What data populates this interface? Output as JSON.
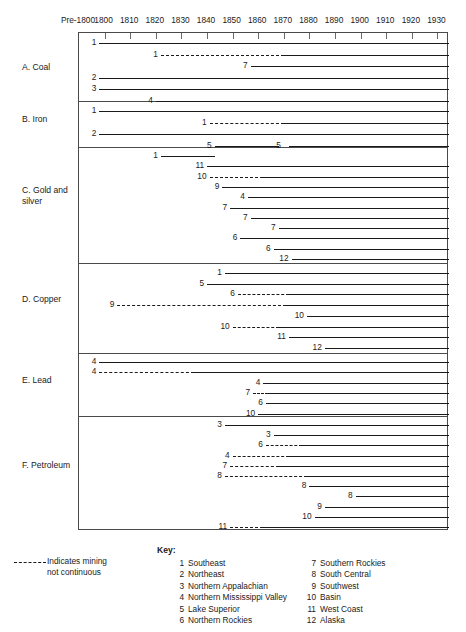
{
  "axis": {
    "ticks": [
      "Pre-1800",
      "1800",
      "1810",
      "1820",
      "1830",
      "1840",
      "1850",
      "1860",
      "1870",
      "1880",
      "1890",
      "1900",
      "1910",
      "1920",
      "1930"
    ]
  },
  "categories": [
    {
      "id": "coal",
      "label": "A. Coal"
    },
    {
      "id": "iron",
      "label": "B. Iron"
    },
    {
      "id": "gold-silver",
      "label": "C. Gold and\n     silver"
    },
    {
      "id": "copper",
      "label": "D. Copper"
    },
    {
      "id": "lead",
      "label": "E. Lead"
    },
    {
      "id": "petroleum",
      "label": "F. Petroleum"
    }
  ],
  "note": {
    "text": "Indicates mining\nnot continuous"
  },
  "key": {
    "title": "Key:",
    "left": [
      {
        "num": "1",
        "label": "Southeast"
      },
      {
        "num": "2",
        "label": "Northeast"
      },
      {
        "num": "3",
        "label": "Northern Appalachian"
      },
      {
        "num": "4",
        "label": "Northern Mississippi Valley"
      },
      {
        "num": "5",
        "label": "Lake Superior"
      },
      {
        "num": "6",
        "label": "Northern Rockies"
      }
    ],
    "right": [
      {
        "num": "7",
        "label": "Southern Rockies"
      },
      {
        "num": "8",
        "label": "South Central"
      },
      {
        "num": "9",
        "label": "Southwest"
      },
      {
        "num": "10",
        "label": "Basin"
      },
      {
        "num": "11",
        "label": "West Coast"
      },
      {
        "num": "12",
        "label": "Alaska"
      }
    ]
  },
  "chart_data": {
    "type": "bar",
    "xlabel": "",
    "ylabel": "",
    "xlim": [
      1795,
      1935
    ],
    "x_ticks": [
      "Pre-1800",
      "1800",
      "1810",
      "1820",
      "1830",
      "1840",
      "1850",
      "1860",
      "1870",
      "1880",
      "1890",
      "1900",
      "1910",
      "1920",
      "1930"
    ],
    "grid": false,
    "legend_position": "bottom",
    "note": "Dashed segments indicate mining not continuous",
    "sections": [
      {
        "name": "A. Coal",
        "bars": [
          {
            "label": "1",
            "start": 1798,
            "end": 1935,
            "segments": [
              {
                "from": 1798,
                "to": 1935,
                "style": "solid"
              }
            ]
          },
          {
            "label": "1",
            "start": 1822,
            "end": 1935,
            "segments": [
              {
                "from": 1822,
                "to": 1870,
                "style": "dashed"
              },
              {
                "from": 1870,
                "to": 1935,
                "style": "solid"
              }
            ]
          },
          {
            "label": "7",
            "start": 1857,
            "end": 1935,
            "segments": [
              {
                "from": 1857,
                "to": 1935,
                "style": "solid"
              }
            ]
          },
          {
            "label": "2",
            "start": 1798,
            "end": 1935,
            "segments": [
              {
                "from": 1798,
                "to": 1935,
                "style": "solid"
              }
            ]
          },
          {
            "label": "3",
            "start": 1798,
            "end": 1935,
            "segments": [
              {
                "from": 1798,
                "to": 1935,
                "style": "solid"
              }
            ]
          },
          {
            "label": "4",
            "start": 1820,
            "end": 1935,
            "segments": [
              {
                "from": 1820,
                "to": 1935,
                "style": "solid"
              }
            ]
          }
        ]
      },
      {
        "name": "B. Iron",
        "bars": [
          {
            "label": "1",
            "start": 1798,
            "end": 1935,
            "segments": [
              {
                "from": 1798,
                "to": 1935,
                "style": "solid"
              }
            ]
          },
          {
            "label": "1",
            "start": 1841,
            "end": 1935,
            "segments": [
              {
                "from": 1841,
                "to": 1870,
                "style": "dashed"
              },
              {
                "from": 1870,
                "to": 1935,
                "style": "solid"
              }
            ]
          },
          {
            "label": "2",
            "start": 1798,
            "end": 1935,
            "segments": [
              {
                "from": 1798,
                "to": 1935,
                "style": "solid"
              }
            ]
          },
          {
            "label": "5",
            "start": 1843,
            "end": 1935,
            "segments": [
              {
                "from": 1843,
                "to": 1868,
                "style": "solid"
              },
              {
                "from": 1872,
                "to": 1935,
                "style": "solid"
              }
            ],
            "inner_label": {
              "num": "5",
              "at": 1870
            }
          }
        ]
      },
      {
        "name": "C. Gold and silver",
        "bars": [
          {
            "label": "1",
            "start": 1822,
            "end": 1843,
            "segments": [
              {
                "from": 1822,
                "to": 1843,
                "style": "solid"
              }
            ]
          },
          {
            "label": "11",
            "start": 1840,
            "end": 1935,
            "segments": [
              {
                "from": 1840,
                "to": 1935,
                "style": "solid"
              }
            ]
          },
          {
            "label": "10",
            "start": 1841,
            "end": 1935,
            "segments": [
              {
                "from": 1841,
                "to": 1862,
                "style": "dashed"
              },
              {
                "from": 1862,
                "to": 1935,
                "style": "solid"
              }
            ]
          },
          {
            "label": "9",
            "start": 1846,
            "end": 1935,
            "segments": [
              {
                "from": 1846,
                "to": 1935,
                "style": "solid"
              }
            ]
          },
          {
            "label": "4",
            "start": 1856,
            "end": 1935,
            "segments": [
              {
                "from": 1856,
                "to": 1935,
                "style": "solid"
              }
            ]
          },
          {
            "label": "7",
            "start": 1849,
            "end": 1935,
            "segments": [
              {
                "from": 1849,
                "to": 1935,
                "style": "solid"
              }
            ]
          },
          {
            "label": "7",
            "start": 1857,
            "end": 1935,
            "segments": [
              {
                "from": 1857,
                "to": 1935,
                "style": "solid"
              }
            ]
          },
          {
            "label": "7",
            "start": 1868,
            "end": 1935,
            "segments": [
              {
                "from": 1868,
                "to": 1935,
                "style": "solid"
              }
            ]
          },
          {
            "label": "6",
            "start": 1853,
            "end": 1935,
            "segments": [
              {
                "from": 1853,
                "to": 1935,
                "style": "solid"
              }
            ]
          },
          {
            "label": "6",
            "start": 1866,
            "end": 1935,
            "segments": [
              {
                "from": 1866,
                "to": 1935,
                "style": "solid"
              }
            ]
          },
          {
            "label": "12",
            "start": 1873,
            "end": 1935,
            "segments": [
              {
                "from": 1873,
                "to": 1935,
                "style": "solid"
              }
            ]
          }
        ]
      },
      {
        "name": "D. Copper",
        "bars": [
          {
            "label": "1",
            "start": 1847,
            "end": 1935,
            "segments": [
              {
                "from": 1847,
                "to": 1935,
                "style": "solid"
              }
            ]
          },
          {
            "label": "5",
            "start": 1840,
            "end": 1935,
            "segments": [
              {
                "from": 1840,
                "to": 1935,
                "style": "solid"
              }
            ]
          },
          {
            "label": "6",
            "start": 1852,
            "end": 1935,
            "segments": [
              {
                "from": 1852,
                "to": 1872,
                "style": "dashed"
              },
              {
                "from": 1872,
                "to": 1935,
                "style": "solid"
              }
            ]
          },
          {
            "label": "9",
            "start": 1805,
            "end": 1935,
            "segments": [
              {
                "from": 1805,
                "to": 1871,
                "style": "dashed"
              },
              {
                "from": 1871,
                "to": 1935,
                "style": "solid"
              }
            ]
          },
          {
            "label": "10",
            "start": 1879,
            "end": 1935,
            "segments": [
              {
                "from": 1879,
                "to": 1935,
                "style": "solid"
              }
            ]
          },
          {
            "label": "10",
            "start": 1850,
            "end": 1935,
            "segments": [
              {
                "from": 1850,
                "to": 1868,
                "style": "dashed"
              },
              {
                "from": 1868,
                "to": 1935,
                "style": "solid"
              }
            ]
          },
          {
            "label": "11",
            "start": 1872,
            "end": 1935,
            "segments": [
              {
                "from": 1872,
                "to": 1935,
                "style": "solid"
              }
            ]
          },
          {
            "label": "12",
            "start": 1886,
            "end": 1935,
            "segments": [
              {
                "from": 1886,
                "to": 1935,
                "style": "solid"
              }
            ]
          }
        ]
      },
      {
        "name": "E. Lead",
        "bars": [
          {
            "label": "4",
            "start": 1798,
            "end": 1935,
            "segments": [
              {
                "from": 1798,
                "to": 1935,
                "style": "solid"
              }
            ]
          },
          {
            "label": "4",
            "start": 1798,
            "end": 1935,
            "segments": [
              {
                "from": 1798,
                "to": 1835,
                "style": "dashed"
              },
              {
                "from": 1835,
                "to": 1935,
                "style": "solid"
              }
            ]
          },
          {
            "label": "4",
            "start": 1862,
            "end": 1935,
            "segments": [
              {
                "from": 1862,
                "to": 1935,
                "style": "solid"
              }
            ]
          },
          {
            "label": "7",
            "start": 1858,
            "end": 1935,
            "segments": [
              {
                "from": 1858,
                "to": 1864,
                "style": "dashed"
              },
              {
                "from": 1864,
                "to": 1935,
                "style": "solid"
              }
            ]
          },
          {
            "label": "6",
            "start": 1863,
            "end": 1935,
            "segments": [
              {
                "from": 1863,
                "to": 1935,
                "style": "solid"
              }
            ]
          },
          {
            "label": "10",
            "start": 1860,
            "end": 1935,
            "segments": [
              {
                "from": 1860,
                "to": 1935,
                "style": "solid"
              }
            ]
          }
        ]
      },
      {
        "name": "F. Petroleum",
        "bars": [
          {
            "label": "3",
            "start": 1847,
            "end": 1935,
            "segments": [
              {
                "from": 1847,
                "to": 1935,
                "style": "solid"
              }
            ]
          },
          {
            "label": "3",
            "start": 1866,
            "end": 1935,
            "segments": [
              {
                "from": 1866,
                "to": 1935,
                "style": "solid"
              }
            ]
          },
          {
            "label": "6",
            "start": 1863,
            "end": 1935,
            "segments": [
              {
                "from": 1863,
                "to": 1877,
                "style": "dashed"
              },
              {
                "from": 1877,
                "to": 1935,
                "style": "solid"
              }
            ]
          },
          {
            "label": "4",
            "start": 1850,
            "end": 1935,
            "segments": [
              {
                "from": 1850,
                "to": 1872,
                "style": "dashed"
              },
              {
                "from": 1872,
                "to": 1935,
                "style": "solid"
              }
            ]
          },
          {
            "label": "7",
            "start": 1849,
            "end": 1935,
            "segments": [
              {
                "from": 1849,
                "to": 1868,
                "style": "dashed"
              },
              {
                "from": 1868,
                "to": 1935,
                "style": "solid"
              }
            ]
          },
          {
            "label": "8",
            "start": 1847,
            "end": 1935,
            "segments": [
              {
                "from": 1847,
                "to": 1879,
                "style": "dashed"
              },
              {
                "from": 1879,
                "to": 1935,
                "style": "solid"
              }
            ]
          },
          {
            "label": "8",
            "start": 1880,
            "end": 1935,
            "segments": [
              {
                "from": 1880,
                "to": 1935,
                "style": "solid"
              }
            ]
          },
          {
            "label": "8",
            "start": 1898,
            "end": 1935,
            "segments": [
              {
                "from": 1898,
                "to": 1935,
                "style": "solid"
              }
            ]
          },
          {
            "label": "9",
            "start": 1886,
            "end": 1935,
            "segments": [
              {
                "from": 1886,
                "to": 1935,
                "style": "solid"
              }
            ]
          },
          {
            "label": "10",
            "start": 1882,
            "end": 1935,
            "segments": [
              {
                "from": 1882,
                "to": 1935,
                "style": "solid"
              }
            ]
          },
          {
            "label": "11",
            "start": 1849,
            "end": 1935,
            "segments": [
              {
                "from": 1849,
                "to": 1862,
                "style": "dashed"
              },
              {
                "from": 1862,
                "to": 1935,
                "style": "solid"
              }
            ]
          }
        ]
      }
    ]
  },
  "layout": {
    "section_row_counts": [
      6,
      4,
      11,
      8,
      6,
      11
    ],
    "section_tops": [
      0,
      68,
      114,
      230,
      320,
      383
    ],
    "section_heights": [
      68,
      46,
      116,
      90,
      63,
      115
    ],
    "row_pitch": [
      11.5,
      11.5,
      10.3,
      10.7,
      10.3,
      10.2
    ],
    "row_offset": [
      5,
      5,
      4,
      5,
      4,
      4
    ],
    "cat_label_tops": [
      62,
      114,
      185,
      294,
      375,
      460
    ]
  }
}
